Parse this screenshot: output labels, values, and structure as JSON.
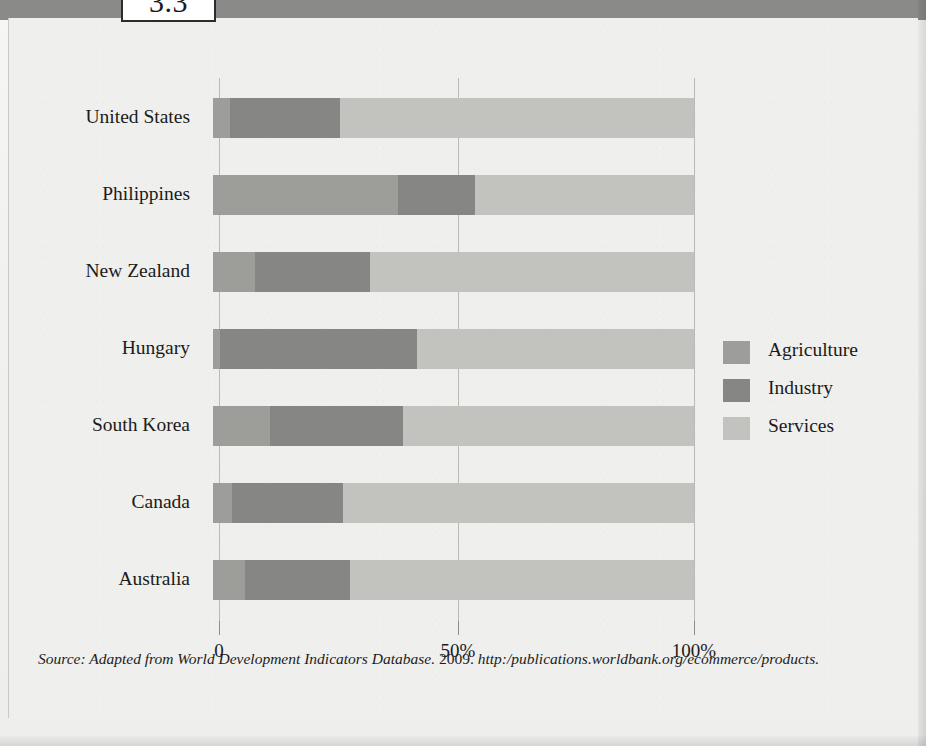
{
  "figure": {
    "number": "3.3"
  },
  "legend": {
    "items": [
      {
        "label": "Agriculture",
        "color": "#9d9d9a",
        "key": "agriculture"
      },
      {
        "label": "Industry",
        "color": "#868684",
        "key": "industry"
      },
      {
        "label": "Services",
        "color": "#c2c2be",
        "key": "services"
      }
    ]
  },
  "axis": {
    "ticks": [
      {
        "label": "0",
        "value": 0
      },
      {
        "label": "50%",
        "value": 50
      },
      {
        "label": "100%",
        "value": 100
      }
    ]
  },
  "source": {
    "prefix": "Source: Adapted from World Development Indicators Database.",
    "year": "2009.",
    "url": "http:/publications.worldbank.org/ecommerce/products."
  },
  "chart_data": {
    "type": "bar",
    "orientation": "horizontal",
    "stacked": true,
    "normalized": true,
    "title": "",
    "xlabel": "",
    "ylabel": "",
    "xlim": [
      0,
      100
    ],
    "grid": true,
    "legend_position": "right",
    "categories": [
      "United States",
      "Philippines",
      "New Zealand",
      "Hungary",
      "South Korea",
      "Canada",
      "Australia"
    ],
    "series": [
      {
        "name": "Agriculture",
        "color": "#9d9d9a",
        "values": [
          3.5,
          38.5,
          8.7,
          1.5,
          11.8,
          4.0,
          6.6
        ]
      },
      {
        "name": "Industry",
        "color": "#868684",
        "values": [
          23.0,
          16.0,
          24.0,
          41.0,
          27.7,
          23.0,
          21.8
        ]
      },
      {
        "name": "Services",
        "color": "#c2c2be",
        "values": [
          73.5,
          45.5,
          67.3,
          57.5,
          60.5,
          73.0,
          71.6
        ]
      }
    ]
  }
}
